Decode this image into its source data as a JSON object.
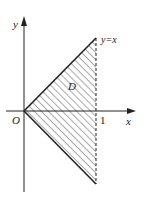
{
  "figure": {
    "axes": {
      "x_label": "x",
      "y_label": "y",
      "origin_label": "O",
      "x_tick_label": "1"
    },
    "region": {
      "label": "D",
      "boundary_label": "y=x",
      "description": "Triangle bounded by y=x, y=-x and x=1 (dashed), hatched"
    },
    "colors": {
      "line": "#222222",
      "hatch": "#555555",
      "background": "#ffffff"
    }
  }
}
